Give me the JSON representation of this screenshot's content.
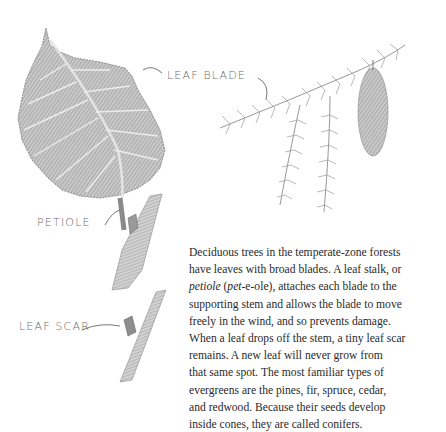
{
  "labels": {
    "leaf_blade": "LEAF BLADE",
    "petiole": "PETIOLE",
    "leaf_scar": "LEAF SCAR"
  },
  "paragraph": {
    "lines": [
      "Deciduous trees in the temperate-zone forests",
      "have leaves with broad blades. A leaf stalk, or",
      "",
      "supporting stem and allows the blade to move",
      "freely in the wind, and so prevents damage.",
      "When a leaf drops off the stem, a tiny leaf scar",
      "remains. A new leaf will never grow from",
      "that same spot. The most familiar types of",
      "evergreens are the pines, fir, spruce, cedar,",
      "and redwood. Because their seeds develop",
      "inside cones, they are called conifers."
    ],
    "line3_italic_1": "petiole",
    "line3_mid": " (",
    "line3_italic_2": "pet",
    "line3_rest": "-e-ole), attaches each blade to the"
  },
  "illustrations": {
    "broadleaf": "deciduous leaf with petiole and stem",
    "conifer": "evergreen branch with cone",
    "twig": "stem with leaf scar"
  }
}
